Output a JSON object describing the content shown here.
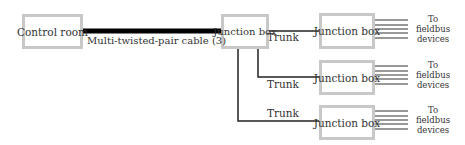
{
  "diagram": {
    "nodes": {
      "control_room": "Control room",
      "main_junction": "Junction box",
      "junction_1": "Junction box",
      "junction_2": "Junction box",
      "junction_3": "Junction box"
    },
    "edges": {
      "main_cable": "Multi-twisted-pair cable (3)",
      "trunk_1": "Trunk",
      "trunk_2": "Trunk",
      "trunk_3": "Trunk"
    },
    "fieldbus": {
      "line1": "To",
      "line2": "fieldbus",
      "line3": "devices"
    },
    "colors": {
      "box_border": "#c8c8c8",
      "line": "#222222"
    }
  }
}
